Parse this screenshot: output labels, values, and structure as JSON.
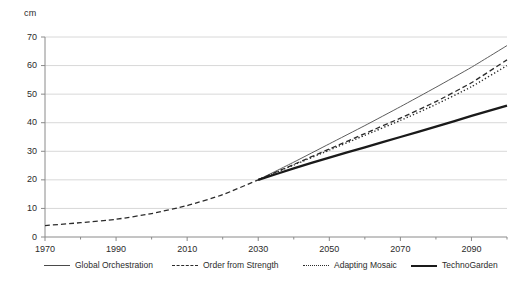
{
  "chart_data": {
    "type": "line",
    "title": "",
    "xlabel": "",
    "ylabel": "cm",
    "ylim": [
      0,
      70
    ],
    "xlim": [
      1970,
      2100
    ],
    "grid": true,
    "legend_position": "bottom",
    "y_ticks": [
      0,
      10,
      20,
      30,
      40,
      50,
      60,
      70
    ],
    "y_tick_labels": [
      "0",
      "10",
      "20",
      "30",
      "40",
      "50",
      "60",
      "70"
    ],
    "x_ticks": [
      1970,
      1990,
      2010,
      2030,
      2050,
      2070,
      2090
    ],
    "x_tick_labels": [
      "1970",
      "1990",
      "2010",
      "2030",
      "2050",
      "2070",
      "2090"
    ],
    "x": [
      1970,
      1980,
      1990,
      2000,
      2010,
      2020,
      2030,
      2040,
      2050,
      2060,
      2070,
      2080,
      2090,
      2100
    ],
    "series": [
      {
        "name": "Global Orchestration",
        "style": "solid-thin",
        "color": "#4a4a4a",
        "values": [
          4.0,
          5.0,
          6.2,
          8.2,
          11.0,
          14.8,
          20.0,
          26.2,
          32.6,
          39.0,
          45.6,
          52.4,
          59.4,
          67.0
        ]
      },
      {
        "name": "Order from Strength",
        "style": "dashed",
        "color": "#2b2b2b",
        "values": [
          4.0,
          5.0,
          6.2,
          8.2,
          11.0,
          14.8,
          20.0,
          25.4,
          30.8,
          36.2,
          41.6,
          47.4,
          54.0,
          62.0
        ]
      },
      {
        "name": "Adapting Mosaic",
        "style": "dotted",
        "color": "#2b2b2b",
        "values": [
          4.0,
          5.0,
          6.2,
          8.2,
          11.0,
          14.8,
          20.0,
          25.2,
          30.4,
          35.6,
          40.8,
          46.4,
          52.6,
          60.0
        ]
      },
      {
        "name": "TechnoGarden",
        "style": "solid-thick",
        "color": "#1a1a1a",
        "values": [
          4.0,
          5.0,
          6.2,
          8.2,
          11.0,
          14.8,
          20.0,
          24.0,
          27.8,
          31.4,
          35.0,
          38.6,
          42.4,
          46.0
        ]
      }
    ],
    "historical_segment": {
      "note": "All scenarios share one dashed historical path from 1970 to 2030",
      "style": "dashed",
      "x": [
        1970,
        1980,
        1990,
        2000,
        2010,
        2020,
        2030
      ],
      "values": [
        4.0,
        5.0,
        6.2,
        8.2,
        11.0,
        14.8,
        20.0
      ]
    }
  },
  "legend": {
    "items": [
      {
        "label": "Global Orchestration"
      },
      {
        "label": "Order from Strength"
      },
      {
        "label": "Adapting Mosaic"
      },
      {
        "label": "TechnoGarden"
      }
    ]
  }
}
